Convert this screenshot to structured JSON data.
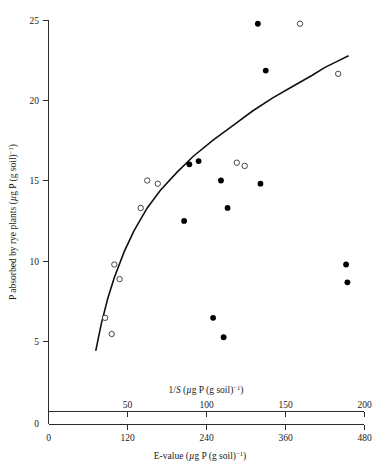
{
  "chart_data": {
    "type": "scatter",
    "title": "",
    "xlabel": "E-value (μg P (g soil)⁻¹)",
    "xlabel_top": "1/S (μg P (g soil)⁻¹)",
    "ylabel": "P absorbed by rye plants (μg P (g soil)⁻¹)",
    "xlim": [
      0,
      480
    ],
    "xlim_top": [
      0,
      200
    ],
    "ylim": [
      0,
      25
    ],
    "grid": false,
    "legend": "none",
    "x_ticks": [
      0,
      120,
      240,
      360,
      480
    ],
    "x_ticks_top": [
      50,
      100,
      150,
      200
    ],
    "y_ticks": [
      0,
      5,
      10,
      15,
      20,
      25
    ],
    "axis_ratio_note": "top axis 1/S = bottom E-value / 2.4",
    "series": [
      {
        "name": "filled-circles",
        "marker": "filled-circle",
        "color": "#000000",
        "points": [
          {
            "x": 206,
            "y": 12.6
          },
          {
            "x": 214,
            "y": 16.1
          },
          {
            "x": 228,
            "y": 16.3
          },
          {
            "x": 250,
            "y": 6.6
          },
          {
            "x": 262,
            "y": 15.1
          },
          {
            "x": 266,
            "y": 5.4
          },
          {
            "x": 272,
            "y": 13.4
          },
          {
            "x": 318,
            "y": 24.8
          },
          {
            "x": 322,
            "y": 14.9
          },
          {
            "x": 330,
            "y": 21.9
          },
          {
            "x": 452,
            "y": 9.9
          },
          {
            "x": 454,
            "y": 8.8
          }
        ]
      },
      {
        "name": "open-circles",
        "marker": "open-circle",
        "color": "#333333",
        "points": [
          {
            "x": 86,
            "y": 6.6
          },
          {
            "x": 96,
            "y": 5.6
          },
          {
            "x": 100,
            "y": 9.9
          },
          {
            "x": 108,
            "y": 9.0
          },
          {
            "x": 140,
            "y": 13.4
          },
          {
            "x": 150,
            "y": 15.1
          },
          {
            "x": 166,
            "y": 14.9
          },
          {
            "x": 286,
            "y": 16.2
          },
          {
            "x": 298,
            "y": 16.0
          },
          {
            "x": 382,
            "y": 24.8
          },
          {
            "x": 440,
            "y": 21.7
          }
        ]
      }
    ],
    "fit_curve": {
      "name": "fitted-saturation-curve",
      "points": [
        {
          "x": 72,
          "y": 4.6
        },
        {
          "x": 80,
          "y": 6.2
        },
        {
          "x": 90,
          "y": 7.8
        },
        {
          "x": 100,
          "y": 9.1
        },
        {
          "x": 115,
          "y": 10.7
        },
        {
          "x": 130,
          "y": 12.0
        },
        {
          "x": 150,
          "y": 13.4
        },
        {
          "x": 170,
          "y": 14.5
        },
        {
          "x": 195,
          "y": 15.6
        },
        {
          "x": 220,
          "y": 16.6
        },
        {
          "x": 250,
          "y": 17.6
        },
        {
          "x": 280,
          "y": 18.5
        },
        {
          "x": 310,
          "y": 19.4
        },
        {
          "x": 340,
          "y": 20.2
        },
        {
          "x": 370,
          "y": 20.9
        },
        {
          "x": 400,
          "y": 21.6
        },
        {
          "x": 420,
          "y": 22.1
        },
        {
          "x": 440,
          "y": 22.5
        },
        {
          "x": 455,
          "y": 22.8
        }
      ]
    }
  }
}
